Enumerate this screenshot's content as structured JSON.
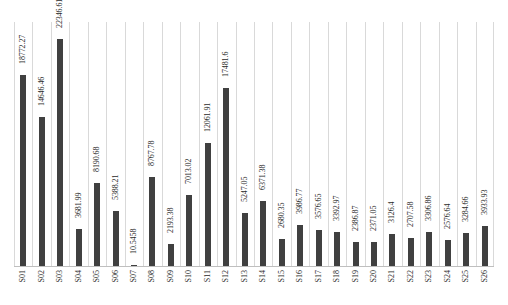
{
  "chart_data": {
    "type": "bar",
    "title": "",
    "subtitle": "",
    "xlabel": "",
    "ylabel": "",
    "categories": [
      "S01",
      "S02",
      "S03",
      "S04",
      "S05",
      "S06",
      "S07",
      "S08",
      "S09",
      "S10",
      "S11",
      "S12",
      "S13",
      "S14",
      "S15",
      "S16",
      "S17",
      "S18",
      "S19",
      "S20",
      "S21",
      "S22",
      "S23",
      "S24",
      "S25",
      "S26"
    ],
    "values": [
      18772.27,
      14646.46,
      22346.61,
      3681.99,
      8190.68,
      5388.21,
      10.5458,
      8767.78,
      2193.38,
      7013.02,
      12061.91,
      17481.6,
      5247.05,
      6371.38,
      2680.35,
      3986.77,
      3576.65,
      3392.97,
      2386.87,
      2371.05,
      3126.4,
      2707.58,
      3306.86,
      2576.64,
      3284.66,
      3933.93
    ],
    "labels": [
      "18772.27",
      "14646.46",
      "22346.61",
      "3681.99",
      "8190.68",
      "5388.21",
      "10.5458",
      "8767.78",
      "2193.38",
      "7013.02",
      "12061.91",
      "17481.6",
      "5247.05",
      "6371.38",
      "2680.35",
      "3986.77",
      "3576.65",
      "3392.97",
      "2386.87",
      "2371.05",
      "3126.4",
      "2707.58",
      "3306.86",
      "2576.64",
      "3284.66",
      "3933.93"
    ],
    "ylim": [
      0,
      24000
    ],
    "grid": "vertical-only",
    "legend": "none",
    "bar_color": "#404040",
    "gridline_color": "#d9d9d9",
    "axis_color": "#bfbfbf",
    "label_rotation": -90,
    "tick_rotation": -90
  },
  "footer": {
    "caption": ""
  }
}
